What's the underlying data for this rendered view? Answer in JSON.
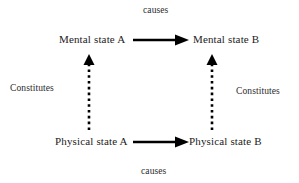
{
  "diagram": {
    "background_color": "#ffffff",
    "ink_color": "#000000",
    "text_color": "#1c1c1c",
    "nodes": [
      {
        "id": "mental-state-a",
        "label": "Mental state A"
      },
      {
        "id": "mental-state-b",
        "label": "Mental state B"
      },
      {
        "id": "physical-state-a",
        "label": "Physical state A"
      },
      {
        "id": "physical-state-b",
        "label": "Physical state B"
      }
    ],
    "edges": [
      {
        "id": "causes-top",
        "label": "causes",
        "from": "mental-state-a",
        "to": "mental-state-b",
        "style": "solid",
        "direction": "right"
      },
      {
        "id": "causes-bottom",
        "label": "causes",
        "from": "physical-state-a",
        "to": "physical-state-b",
        "style": "solid",
        "direction": "right"
      },
      {
        "id": "constitutes-left",
        "label": "Constitutes",
        "from": "physical-state-a",
        "to": "mental-state-a",
        "style": "dotted",
        "direction": "up"
      },
      {
        "id": "constitutes-right",
        "label": "Constitutes",
        "from": "physical-state-b",
        "to": "mental-state-b",
        "style": "dotted",
        "direction": "up"
      }
    ]
  }
}
